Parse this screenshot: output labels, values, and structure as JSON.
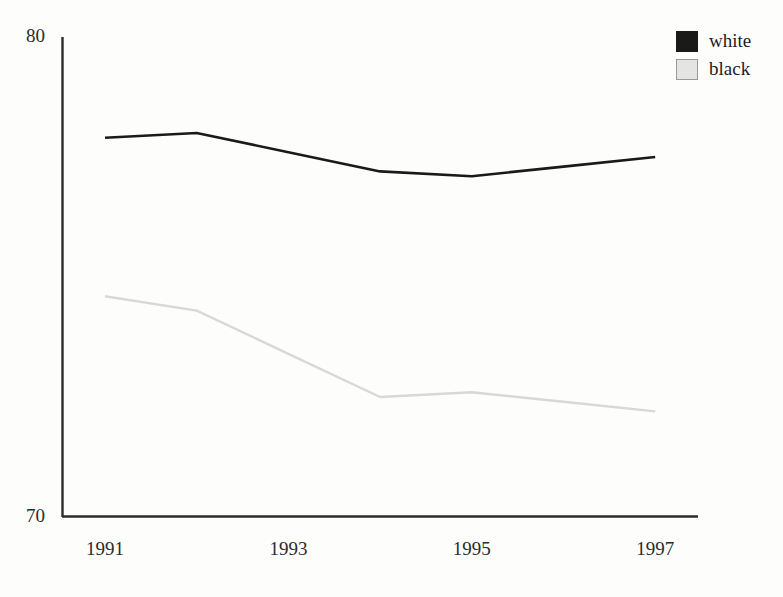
{
  "chart_data": {
    "type": "line",
    "title": "",
    "xlabel": "",
    "ylabel": "",
    "x": [
      1991,
      1992,
      1993,
      1994,
      1995,
      1996,
      1997
    ],
    "tick_labels": [
      "1991",
      "1993",
      "1995",
      "1997"
    ],
    "tick_values": [
      1991,
      1993,
      1995,
      1997
    ],
    "ylim": [
      70,
      80
    ],
    "y_axis_ticks": [
      "80",
      "70"
    ],
    "grid": false,
    "legend_position": "top-right",
    "series": [
      {
        "name": "white",
        "color": "#1a1a1a",
        "values": [
          77.9,
          78.0,
          77.6,
          77.2,
          77.1,
          77.3,
          77.5
        ]
      },
      {
        "name": "black",
        "color": "#d8d8d8",
        "values": [
          74.6,
          74.3,
          73.4,
          72.5,
          72.6,
          72.4,
          72.2
        ]
      }
    ]
  },
  "legend": {
    "entries": [
      {
        "label": "white",
        "swatch_color": "#1a1a1a",
        "swatch_border": "#1a1a1a"
      },
      {
        "label": "black",
        "swatch_color": "#e4e4e4",
        "swatch_border": "#9a9a9a"
      }
    ]
  },
  "axes": {
    "y_top_label": "80",
    "y_bottom_label": "70",
    "axis_color": "#2b2b2b"
  },
  "geometry": {
    "x_axis_y": 517,
    "y_axis_x": 62,
    "y_axis_top": 37,
    "x_axis_right": 698,
    "x_first": 105,
    "x_step": 91.7,
    "y_value_top": 80,
    "y_value_bottom": 70
  }
}
